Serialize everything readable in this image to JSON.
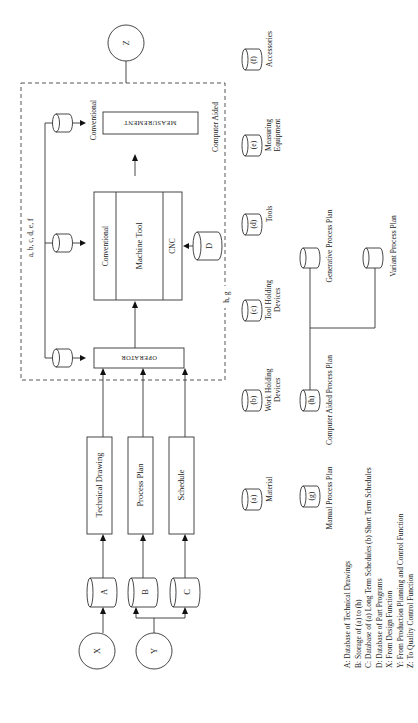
{
  "diagram": {
    "nodes": {
      "Z": "Z",
      "X": "X",
      "Y": "Y",
      "A": "A",
      "B": "B",
      "C": "C",
      "D": "D"
    },
    "inputs": {
      "technical_drawing": "Technical Drawing",
      "process_plan": "Process Plan",
      "schedule": "Schedule"
    },
    "shop_floor": {
      "operator": "OPERATOR",
      "machine_tool": "Machine Tool",
      "conventional_mt": "Conventional",
      "cnc": "CNC",
      "measurement": "MEASUREMENT",
      "measurement_conventional": "Conventional",
      "measurement_computer_aided": "Computer Aided",
      "resources_label": "a, b, c, d, e, f",
      "plan_label": "h, g"
    },
    "resources": [
      {
        "key": "(a)",
        "label": "Material"
      },
      {
        "key": "(b)",
        "label_line1": "Work Holding",
        "label_line2": "Devices"
      },
      {
        "key": "(c)",
        "label_line1": "Tool Holding",
        "label_line2": "Devices"
      },
      {
        "key": "(d)",
        "label": "Tools"
      },
      {
        "key": "(e)",
        "label_line1": "Measuring",
        "label_line2": "Equipment"
      },
      {
        "key": "(f)",
        "label": "Accessories"
      }
    ],
    "process_plans": {
      "g_key": "(g)",
      "g_label": "Manual Process Plan",
      "h_key": "(h)",
      "h_label": "Computer Aided Process Plan",
      "generative": "Generative Process Plan",
      "variant": "Variant Process Plan"
    },
    "legend": [
      "A:  Database of Technical Drawings",
      "B:  Storage of (a) to (h)",
      "C:  Database of (a) Long Term Schedules (b) Short Term Schedules",
      "D:  Database of Part Programs",
      "X:  From Design Function",
      "Y:  From Production Planning and Control Function",
      "Z:  To Quality Control Function"
    ]
  }
}
